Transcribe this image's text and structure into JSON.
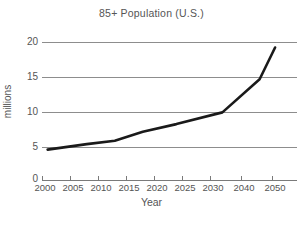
{
  "chart_data": {
    "type": "line",
    "title": "85+ Population (U.S.)",
    "xlabel": "Year",
    "ylabel": "millions",
    "grid": true,
    "legend": "none",
    "xlim": [
      2000,
      2052
    ],
    "ylim": [
      0,
      20
    ],
    "x_tick_labels": [
      "2000",
      "2005",
      "2010",
      "2015",
      "2020",
      "2025",
      "2030",
      "2040",
      "2050"
    ],
    "x_tick_values": [
      2000,
      2005,
      2010,
      2015,
      2020,
      2025,
      2030,
      2040,
      2050
    ],
    "y_tick_labels": [
      "0",
      "5",
      "10",
      "15",
      "20"
    ],
    "y_tick_values": [
      0,
      5,
      10,
      15,
      20
    ],
    "gridline_values": [
      5,
      10,
      15,
      20
    ],
    "x": [
      2001,
      2008,
      2013,
      2018,
      2024,
      2034,
      2046,
      2051
    ],
    "values": [
      4.4,
      5.2,
      5.7,
      7.0,
      8.1,
      9.8,
      14.6,
      19.2
    ],
    "series": [
      {
        "name": "85+ Population (U.S.)",
        "color": "#1a1a1a",
        "points": [
          {
            "year": 2001,
            "millions": 4.4
          },
          {
            "year": 2008,
            "millions": 5.2
          },
          {
            "year": 2013,
            "millions": 5.7
          },
          {
            "year": 2018,
            "millions": 7.0
          },
          {
            "year": 2024,
            "millions": 8.1
          },
          {
            "year": 2034,
            "millions": 9.8
          },
          {
            "year": 2046,
            "millions": 14.6
          },
          {
            "year": 2051,
            "millions": 19.2
          }
        ]
      }
    ]
  },
  "colors": {
    "line": "#1a1a1a",
    "grid": "#8d8d8d",
    "axis": "#7a7a7a",
    "text": "#555555",
    "background": "#ffffff"
  },
  "caption": {
    "partial_text": ""
  }
}
